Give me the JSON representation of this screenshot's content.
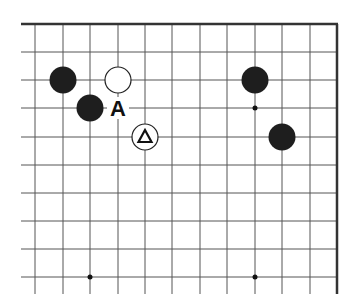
{
  "diagram": {
    "type": "go-board-fragment",
    "columns": 12,
    "rows": 10,
    "edges": [
      "top",
      "right"
    ],
    "grid": {
      "x": [
        35,
        63,
        90,
        118,
        145,
        172,
        200,
        227,
        255,
        282,
        310,
        337
      ],
      "y": [
        24,
        52,
        80,
        108,
        137,
        165,
        193,
        221,
        249,
        277
      ]
    },
    "stones": [
      {
        "color": "black",
        "col": 1,
        "row": 2
      },
      {
        "color": "white",
        "col": 3,
        "row": 2
      },
      {
        "color": "black",
        "col": 2,
        "row": 3
      },
      {
        "color": "white",
        "col": 4,
        "row": 4,
        "mark": "triangle"
      },
      {
        "color": "black",
        "col": 8,
        "row": 2
      },
      {
        "color": "black",
        "col": 9,
        "row": 4
      }
    ],
    "labels": [
      {
        "text": "A",
        "col": 3,
        "row": 3
      }
    ],
    "star_points": [
      {
        "col": 8,
        "row": 3
      },
      {
        "col": 2,
        "row": 9
      },
      {
        "col": 8,
        "row": 9
      }
    ],
    "colors": {
      "line": "#555555",
      "edge": "#333333",
      "black_stone": "#1e1e1e",
      "white_stone": "#ffffff",
      "background": "#ffffff"
    }
  }
}
